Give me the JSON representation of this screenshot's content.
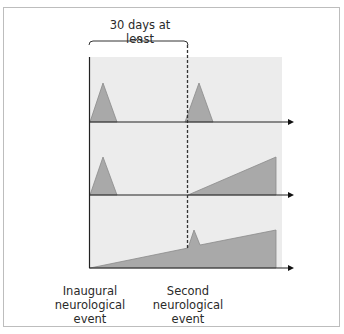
{
  "diagram": {
    "bracket_label": "30 days at least",
    "event_labels": {
      "inaugural": "Inaugural\nneurological\nevent",
      "second": "Second\nneurological\nevent"
    },
    "rows": [
      {
        "name": "relapsing-row",
        "description": "two discrete peaks"
      },
      {
        "name": "secondary-progressive-row",
        "description": "peak then progressive ramp"
      },
      {
        "name": "primary-progressive-row",
        "description": "progressive ramp with superimposed peak"
      }
    ],
    "colors": {
      "panel_background": "#ececec",
      "shape_fill": "#a9a9a9",
      "shape_stroke": "#8a8a8a",
      "axis": "#222222",
      "border": "#bdbdbd"
    }
  }
}
